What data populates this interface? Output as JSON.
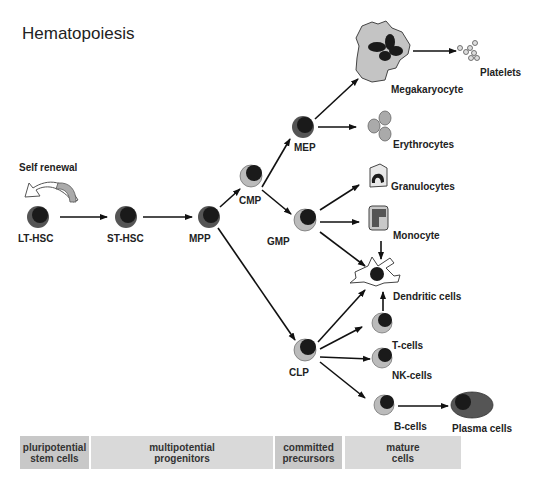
{
  "title": "Hematopoiesis",
  "self_renewal": "Self renewal",
  "nodes": {
    "lt_hsc": "LT-HSC",
    "st_hsc": "ST-HSC",
    "mpp": "MPP",
    "cmp": "CMP",
    "mep": "MEP",
    "gmp": "GMP",
    "clp": "CLP"
  },
  "mature": {
    "megakaryocyte": "Megakaryocyte",
    "platelets": "Platelets",
    "erythrocytes": "Erythrocytes",
    "granulocytes": "Granulocytes",
    "monocyte": "Monocyte",
    "dendritic": "Dendritic cells",
    "t_cells": "T-cells",
    "nk_cells": "NK-cells",
    "b_cells": "B-cells",
    "plasma": "Plasma cells"
  },
  "stages": [
    {
      "label": "pluripotential\nstem cells"
    },
    {
      "label": "multipotential\nprogenitors"
    },
    {
      "label": "committed\nprecursors"
    },
    {
      "label": "mature\ncells"
    }
  ],
  "colors": {
    "nucleus": "#1a1a1a",
    "cytoplasm_gray": "#b4b4b4",
    "cell_dark": "#555555",
    "band": "#d9d9d9",
    "band_dark": "#c8c8c8"
  }
}
